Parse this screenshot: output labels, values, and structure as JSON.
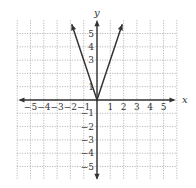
{
  "chart_data": {
    "type": "line",
    "title": "",
    "function": "y = 3|x|",
    "xlabel": "x",
    "ylabel": "y",
    "xlim": [
      -5.5,
      5.5
    ],
    "ylim": [
      -5.5,
      5.5
    ],
    "grid": true,
    "grid_style": "dotted",
    "x_ticks": [
      -5,
      -4,
      -3,
      -2,
      -1,
      1,
      2,
      3,
      4,
      5
    ],
    "y_ticks": [
      -5,
      -4,
      -3,
      -2,
      -1,
      1,
      3,
      4,
      5
    ],
    "x_tick_labels": [
      "−5",
      "−4",
      "−3",
      "−2",
      "−1",
      "1",
      "2",
      "3",
      "4",
      "5"
    ],
    "y_tick_labels": [
      "−5",
      "−4",
      "−3",
      "−2",
      "1",
      "1",
      "3",
      "4",
      "5"
    ],
    "series": [
      {
        "name": "y = 3|x|",
        "x": [
          -1.9,
          0,
          1.9
        ],
        "values": [
          5.7,
          0,
          5.7
        ],
        "arrows": "both-ends"
      }
    ],
    "colors": {
      "curve": "#333333",
      "axis": "#333333",
      "grid": "#9a9a9a"
    }
  },
  "labels": {
    "x_axis": "x",
    "y_axis": "y",
    "x_ticks": [
      "−5",
      "−4",
      "−3",
      "−2",
      "−1",
      "1",
      "2",
      "3",
      "4",
      "5"
    ],
    "y_ticks_pos": [
      "1",
      "3",
      "4",
      "5"
    ],
    "y_ticks_neg": [
      "−1",
      "−2",
      "−3",
      "−4",
      "−5"
    ]
  }
}
